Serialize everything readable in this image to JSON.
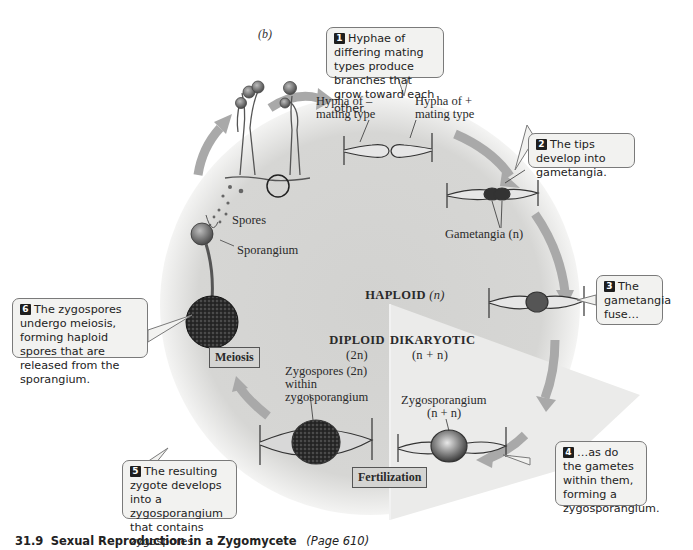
{
  "panel_label": "(b)",
  "colors": {
    "circle_fill": "#d6d6d4",
    "dikaryotic_fill": "#ebebea",
    "arrow": "#a9a9a9",
    "callout_bg": "#f2f2f0",
    "callout_border": "#7a7a7a",
    "number_badge": "#1e1e1e"
  },
  "zones": {
    "haploid": {
      "title": "HAPLOID",
      "sub": "(n)"
    },
    "diploid": {
      "title": "DIPLOID",
      "sub": "(2n)"
    },
    "dikaryotic": {
      "title": "DIKARYOTIC",
      "sub": "(n + n)"
    }
  },
  "steps": [
    {
      "num": "1",
      "text": "Hyphae of differing mating types produce branches that grow toward each other."
    },
    {
      "num": "2",
      "text": "The tips develop into gametangia."
    },
    {
      "num": "3",
      "text": "The gametangia fuse…"
    },
    {
      "num": "4",
      "text": "…as do the gametes within them, forming a zygosporangium."
    },
    {
      "num": "5",
      "text": "The resulting zygote develops into a zygosporangium that contains zygospores."
    },
    {
      "num": "6",
      "text": "The zygospores undergo meiosis, forming haploid spores that are released from the sporangium."
    }
  ],
  "labels": {
    "hypha_minus": "Hypha of –",
    "hypha_minus_2": "mating type",
    "hypha_plus": "Hypha of +",
    "hypha_plus_2": "mating type",
    "gametangia": "Gametangia (n)",
    "spores": "Spores",
    "sporangium": "Sporangium",
    "zygospores_1": "Zygospores (2n)",
    "zygospores_2": "within",
    "zygospores_3": "zygosporangium",
    "zygosporangium": "Zygosporangium",
    "zygosporangium_sub": "(n + n)"
  },
  "process_labels": {
    "meiosis": "Meiosis",
    "fertilization": "Fertilization"
  },
  "caption": {
    "number": "31.9",
    "title": "Sexual Reproduction in a Zygomycete",
    "page": "(Page 610)"
  }
}
